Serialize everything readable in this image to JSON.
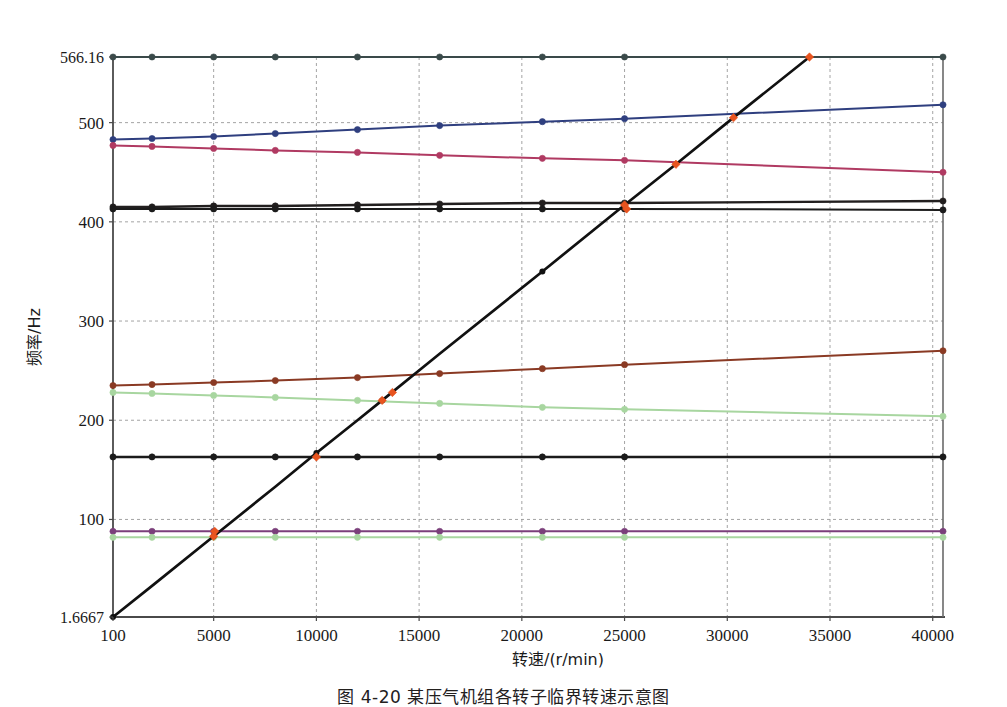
{
  "figure": {
    "caption": "图 4-20  某压气机组各转子临界转速示意图",
    "background_color": "#ffffff"
  },
  "chart_data": {
    "type": "line",
    "title": "",
    "xlabel": "转速/(r/min)",
    "ylabel": "频率/Hz",
    "xlim": [
      100,
      40500
    ],
    "ylim": [
      1.6667,
      566.16
    ],
    "grid": true,
    "grid_style": "dashed",
    "legend": "none",
    "x_ticks": [
      100,
      5000,
      10000,
      15000,
      20000,
      25000,
      30000,
      35000,
      40000
    ],
    "x_tick_labels": [
      "100",
      "5000",
      "10000",
      "15000",
      "20000",
      "25000",
      "30000",
      "35000",
      "40000"
    ],
    "y_ticks": [
      1.6667,
      100,
      200,
      300,
      400,
      500,
      566.16
    ],
    "y_tick_labels": [
      "1.6667",
      "100",
      "200",
      "300",
      "400",
      "500",
      "566.16"
    ],
    "x": [
      100,
      2000,
      5000,
      8000,
      12000,
      16000,
      21000,
      25000,
      40500
    ],
    "series": [
      {
        "name": "上限频率 566.16 Hz",
        "color": "#3a4a4a",
        "marker": "circle",
        "values": [
          566.16,
          566.16,
          566.16,
          566.16,
          566.16,
          566.16,
          566.16,
          566.16,
          566.16
        ]
      },
      {
        "name": "临界转速 1 (上升)",
        "color": "#2f3f7f",
        "marker": "circle",
        "values": [
          483,
          484,
          486,
          489,
          493,
          497,
          501,
          504,
          518
        ]
      },
      {
        "name": "临界转速 2 (下降)",
        "color": "#b03a62",
        "marker": "circle",
        "values": [
          477,
          476,
          474,
          472,
          470,
          467,
          464,
          462,
          450
        ]
      },
      {
        "name": "临界转速 3 (近水平)",
        "color": "#221f1f",
        "marker": "circle",
        "values": [
          415,
          415,
          416,
          416,
          417,
          418,
          419,
          419,
          421
        ]
      },
      {
        "name": "临界转速 4 (近水平)",
        "color": "#1b1b1b",
        "marker": "circle",
        "values": [
          413,
          413,
          413,
          413,
          413,
          413,
          413,
          413,
          412
        ]
      },
      {
        "name": "临界转速 5 (上升)",
        "color": "#8a3a24",
        "marker": "circle",
        "values": [
          235,
          236,
          238,
          240,
          243,
          247,
          252,
          256,
          270
        ]
      },
      {
        "name": "临界转速 6 (下降)",
        "color": "#a8d6a0",
        "marker": "circle",
        "values": [
          228,
          227,
          225,
          223,
          220,
          217,
          213,
          211,
          204
        ]
      },
      {
        "name": "临界转速 7 (水平)",
        "color": "#1b1b1b",
        "marker": "circle",
        "values": [
          163,
          163,
          163,
          163,
          163,
          163,
          163,
          163,
          163
        ]
      },
      {
        "name": "临界转速 8 (水平)",
        "color": "#7b3f7b",
        "marker": "circle",
        "values": [
          88,
          88,
          88,
          88,
          88,
          88,
          88,
          88,
          88
        ]
      },
      {
        "name": "临界转速 9 (水平)",
        "color": "#a8d6a0",
        "marker": "circle",
        "values": [
          82,
          82,
          82,
          82,
          82,
          82,
          82,
          82,
          82
        ]
      }
    ],
    "diagonal": {
      "name": "转速线 (1x)",
      "color": "#111111",
      "x": [
        100,
        2000,
        5000,
        8000,
        10000,
        12000,
        13200,
        16000,
        21000,
        25000,
        27500,
        30300,
        34000
      ],
      "values": [
        1.6667,
        33,
        83,
        133,
        167,
        200,
        220,
        267,
        350,
        417,
        458,
        505,
        566.16
      ]
    },
    "intersections": {
      "color": "#e8541f",
      "marker": "diamond",
      "points": [
        {
          "x": 5000,
          "y": 83
        },
        {
          "x": 5050,
          "y": 88
        },
        {
          "x": 10000,
          "y": 163
        },
        {
          "x": 13200,
          "y": 220
        },
        {
          "x": 13700,
          "y": 228
        },
        {
          "x": 25000,
          "y": 417
        },
        {
          "x": 25100,
          "y": 413
        },
        {
          "x": 27500,
          "y": 458
        },
        {
          "x": 30300,
          "y": 505
        },
        {
          "x": 34000,
          "y": 566.16
        }
      ]
    }
  }
}
